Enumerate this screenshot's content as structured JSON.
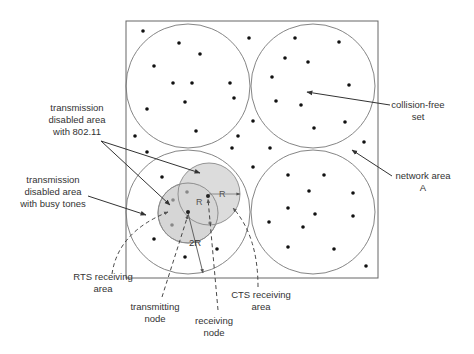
{
  "diagram": {
    "title": "",
    "network_box": {
      "x": 126,
      "y": 21,
      "width": 252,
      "height": 257
    },
    "colors": {
      "line": "#555555",
      "circle_stroke": "#777777",
      "shaded_area": "#d9d9d9",
      "dot": "#111111",
      "text": "#333333"
    },
    "big_circles": [
      {
        "name": "top-left-set",
        "cx": 188,
        "cy": 86,
        "r": 62
      },
      {
        "name": "top-right-set",
        "cx": 313,
        "cy": 86,
        "r": 62
      },
      {
        "name": "bottom-left-set",
        "cx": 188,
        "cy": 212,
        "r": 62
      },
      {
        "name": "bottom-right-set",
        "cx": 313,
        "cy": 212,
        "r": 62
      }
    ],
    "shaded_circles": [
      {
        "name": "transmitter-disabled-area",
        "cx": 188,
        "cy": 213,
        "r": 30
      },
      {
        "name": "receiver-disabled-area",
        "cx": 209,
        "cy": 194,
        "r": 31
      }
    ],
    "nodes": {
      "transmitting": {
        "x": 188,
        "y": 212
      },
      "receiving": {
        "x": 208,
        "y": 196
      }
    },
    "dimension_labels": {
      "r_right": "R",
      "r_inner": "R",
      "two_r": "2R"
    },
    "labels": {
      "disabled_80211": [
        "transmission",
        "disabled area",
        "with 802.11"
      ],
      "disabled_busy_tones": [
        "transmission",
        "disabled area",
        "with busy tones"
      ],
      "collision_free_set": [
        "collision-free",
        "set"
      ],
      "network_area": [
        "network area",
        "A"
      ],
      "rts_receiving_area": [
        "RTS receiving",
        "area"
      ],
      "transmitting_node": [
        "transmitting",
        "node"
      ],
      "receiving_node": [
        "receiving",
        "node"
      ],
      "cts_receiving_area": [
        "CTS receiving",
        "area"
      ]
    },
    "dots": [
      [
        143,
        31
      ],
      [
        179,
        43
      ],
      [
        249,
        38
      ],
      [
        200,
        54
      ],
      [
        154,
        66
      ],
      [
        173,
        83
      ],
      [
        192,
        83
      ],
      [
        230,
        83
      ],
      [
        234,
        98
      ],
      [
        185,
        102
      ],
      [
        147,
        109
      ],
      [
        253,
        121
      ],
      [
        196,
        131
      ],
      [
        135,
        136
      ],
      [
        238,
        136
      ],
      [
        232,
        148
      ],
      [
        147,
        152
      ],
      [
        295,
        38
      ],
      [
        339,
        42
      ],
      [
        285,
        58
      ],
      [
        308,
        62
      ],
      [
        272,
        77
      ],
      [
        349,
        85
      ],
      [
        276,
        101
      ],
      [
        301,
        105
      ],
      [
        345,
        122
      ],
      [
        314,
        128
      ],
      [
        364,
        142
      ],
      [
        270,
        148
      ],
      [
        253,
        167
      ],
      [
        288,
        175
      ],
      [
        324,
        175
      ],
      [
        309,
        191
      ],
      [
        353,
        193
      ],
      [
        288,
        208
      ],
      [
        315,
        214
      ],
      [
        353,
        216
      ],
      [
        269,
        222
      ],
      [
        303,
        227
      ],
      [
        288,
        247
      ],
      [
        334,
        249
      ],
      [
        366,
        266
      ],
      [
        162,
        177
      ],
      [
        154,
        239
      ],
      [
        217,
        249
      ],
      [
        185,
        257
      ]
    ],
    "gray_dots": [
      [
        187,
        192
      ],
      [
        173,
        200
      ],
      [
        172,
        225
      ],
      [
        210,
        223
      ]
    ]
  }
}
